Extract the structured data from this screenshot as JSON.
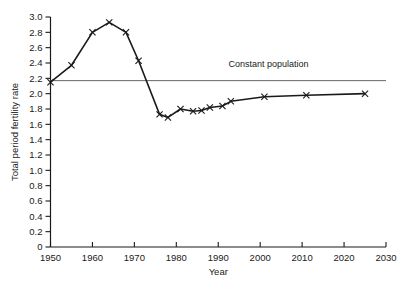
{
  "chart_data": {
    "type": "line",
    "title": "",
    "subtitle": "",
    "xlabel": "Year",
    "ylabel": "Total period fertility rate",
    "xlim": [
      1950,
      2030
    ],
    "ylim": [
      0,
      3.0
    ],
    "xticks": [
      1950,
      1960,
      1970,
      1980,
      1990,
      2000,
      2010,
      2020,
      2030
    ],
    "xtick_labels": [
      "1950",
      "1960",
      "1970",
      "1980",
      "1990",
      "2000",
      "2010",
      "2020",
      "2030"
    ],
    "yticks": [
      0,
      0.2,
      0.4,
      0.6,
      0.8,
      1.0,
      1.2,
      1.4,
      1.6,
      1.8,
      2.0,
      2.2,
      2.4,
      2.6,
      2.8,
      3.0
    ],
    "ytick_labels": [
      "0",
      "0.2",
      "0.4",
      "0.6",
      "0.8",
      "1.0",
      "1.2",
      "1.4",
      "1.6",
      "1.8",
      "2.0",
      "2.2",
      "2.4",
      "2.6",
      "2.8",
      "3.0"
    ],
    "grid": false,
    "legend_position": "none",
    "marker": "x",
    "series": [
      {
        "name": "Total period fertility rate",
        "color": "#1a1a1a",
        "points": [
          {
            "x": 1950,
            "y": 2.15
          },
          {
            "x": 1955,
            "y": 2.37
          },
          {
            "x": 1960,
            "y": 2.8
          },
          {
            "x": 1964,
            "y": 2.93
          },
          {
            "x": 1968,
            "y": 2.8
          },
          {
            "x": 1971,
            "y": 2.43
          },
          {
            "x": 1976,
            "y": 1.73
          },
          {
            "x": 1978,
            "y": 1.69
          },
          {
            "x": 1981,
            "y": 1.8
          },
          {
            "x": 1984,
            "y": 1.77
          },
          {
            "x": 1986,
            "y": 1.78
          },
          {
            "x": 1988,
            "y": 1.82
          },
          {
            "x": 1991,
            "y": 1.84
          },
          {
            "x": 1993,
            "y": 1.9
          },
          {
            "x": 2001,
            "y": 1.96
          },
          {
            "x": 2011,
            "y": 1.98
          },
          {
            "x": 2025,
            "y": 2.0
          }
        ]
      }
    ],
    "annotations": [
      {
        "type": "hline",
        "label": "Constant population",
        "y": 2.17,
        "x_start": 1950,
        "x_end": 2030,
        "color": "#555555",
        "label_x": 2002,
        "label_y": 2.35
      }
    ]
  }
}
